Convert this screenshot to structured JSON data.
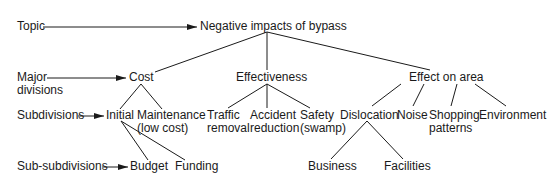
{
  "levels": {
    "topic": "Topic",
    "major_divisions": [
      "Major",
      "divisions"
    ],
    "subdivisions": "Subdivisions",
    "sub_subdivisions": "Sub-subdivisions"
  },
  "tree": {
    "root": "Negative impacts of bypass",
    "major": {
      "cost": "Cost",
      "effectiveness": "Effectiveness",
      "effect_on_area": "Effect on area"
    },
    "sub": {
      "initial": "Initial",
      "maintenance": [
        "Maintenance",
        "(low cost)"
      ],
      "traffic": [
        "Traffic",
        "removal"
      ],
      "accident": [
        "Accident",
        "reduction"
      ],
      "safety": [
        "Safety",
        "(swamp)"
      ],
      "dislocation": "Dislocation",
      "noise": "Noise",
      "shopping": [
        "Shopping",
        "patterns"
      ],
      "environment": "Environment"
    },
    "subsub": {
      "budget": "Budget",
      "funding": "Funding",
      "business": "Business",
      "facilities": "Facilities"
    }
  }
}
